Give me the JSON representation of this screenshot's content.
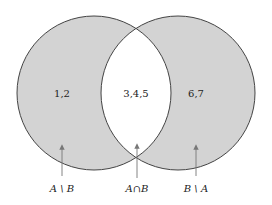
{
  "diagram": {
    "type": "venn",
    "colors": {
      "fill": "#d3d3d3",
      "intersection_fill": "#ffffff",
      "stroke": "#444444",
      "arrow": "#777777",
      "background": "#ffffff"
    },
    "sets": [
      {
        "name": "A",
        "elements": [
          "1",
          "2",
          "3",
          "4",
          "5"
        ]
      },
      {
        "name": "B",
        "elements": [
          "3",
          "4",
          "5",
          "6",
          "7"
        ]
      }
    ],
    "regions": {
      "a_only": {
        "text": "1,2",
        "label": "A \\ B"
      },
      "intersection": {
        "text": "3,4,5",
        "label": "A∩B"
      },
      "b_only": {
        "text": "6,7",
        "label": "B \\ A"
      }
    }
  }
}
